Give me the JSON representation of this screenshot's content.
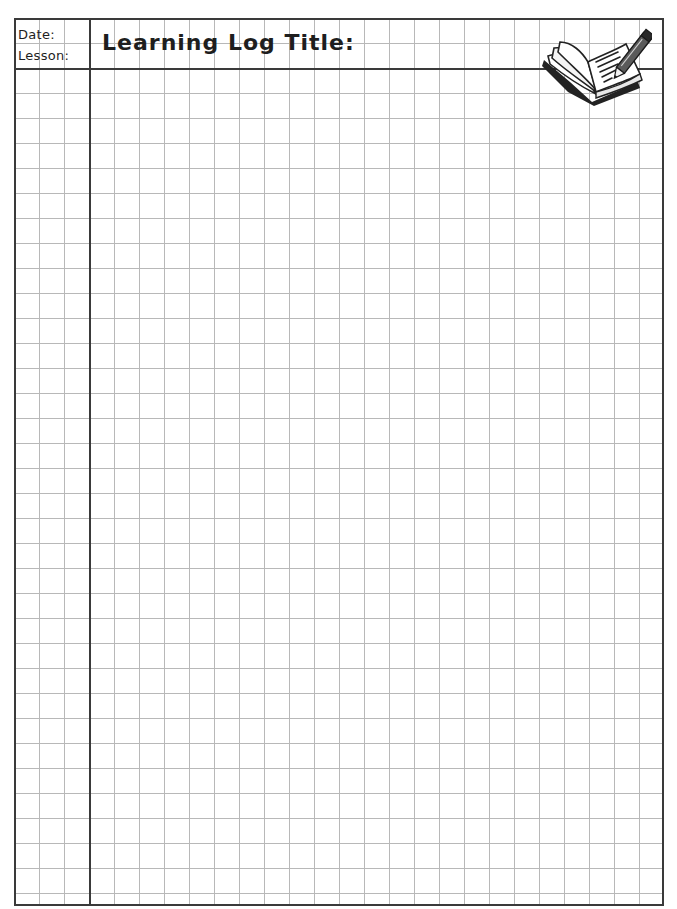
{
  "page": {
    "type": "learning-log-worksheet",
    "grid": {
      "cell_size_px": 25,
      "line_color": "#b8b8b8",
      "border_color": "#3a3a3a"
    }
  },
  "header": {
    "date_label": "Date:",
    "lesson_label": "Lesson:",
    "title_label": "Learning Log Title:",
    "icon": "open-book-with-pencil-icon"
  }
}
